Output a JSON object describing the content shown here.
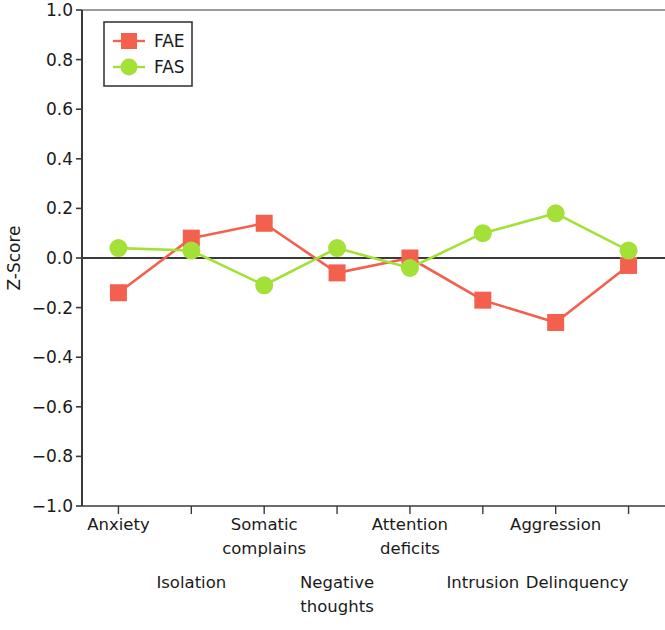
{
  "chart_data": {
    "type": "line",
    "title": "",
    "xlabel": "",
    "ylabel": "Z-Score",
    "ylim": [
      -1.0,
      1.0
    ],
    "yticks": [
      "1.0",
      "0.8",
      "0.6",
      "0.4",
      "0.2",
      "0.0",
      "−0.2",
      "−0.4",
      "−0.6",
      "−0.8",
      "−1.0"
    ],
    "ytick_values": [
      1.0,
      0.8,
      0.6,
      0.4,
      0.2,
      0.0,
      -0.2,
      -0.4,
      -0.6,
      -0.8,
      -1.0
    ],
    "grid": false,
    "zero_line": true,
    "legend_position": "upper left",
    "categories": [
      "Anxiety",
      "Isolation",
      "Somatic complains",
      "Negative thoughts",
      "Attention deficits",
      "Intrusion",
      "Aggression",
      "Delinquency"
    ],
    "category_label_lines": [
      [
        "Anxiety"
      ],
      [
        "Isolation"
      ],
      [
        "Somatic",
        "complains"
      ],
      [
        "Negative",
        "thoughts"
      ],
      [
        "Attention",
        "deficits"
      ],
      [
        "Intrusion"
      ],
      [
        "Aggression"
      ],
      [
        "Delinquency"
      ]
    ],
    "category_label_row": [
      0,
      1,
      0,
      1,
      0,
      1,
      0,
      1
    ],
    "series": [
      {
        "name": "FAE",
        "color": "#f4604e",
        "marker": "square",
        "values": [
          -0.14,
          0.08,
          0.14,
          -0.06,
          0.0,
          -0.17,
          -0.26,
          -0.03
        ]
      },
      {
        "name": "FAS",
        "color": "#a3e038",
        "marker": "circle",
        "values": [
          0.04,
          0.03,
          -0.11,
          0.04,
          -0.04,
          0.1,
          0.18,
          0.03
        ]
      }
    ]
  },
  "colors": {
    "fae": "#f4604e",
    "fas": "#a3e038",
    "axis": "#3a3a3a",
    "zero_line": "#3a3a3a",
    "text": "#1a1a1a",
    "background": "#ffffff",
    "legend_border": "#3a3a3a"
  },
  "legend": {
    "entries": [
      {
        "label": "FAE"
      },
      {
        "label": "FAS"
      }
    ]
  }
}
